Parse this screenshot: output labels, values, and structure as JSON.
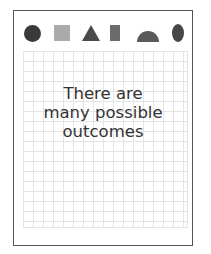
{
  "card": {
    "shapes": [
      {
        "name": "circle-icon",
        "color": "#3a3a3a"
      },
      {
        "name": "square-icon",
        "color": "#aaaaaa"
      },
      {
        "name": "triangle-icon",
        "color": "#4a4a4a"
      },
      {
        "name": "rectangle-icon",
        "color": "#6b6b6b"
      },
      {
        "name": "semicircle-icon",
        "color": "#5a5a5a"
      },
      {
        "name": "oval-icon",
        "color": "#474747"
      }
    ],
    "message_lines": [
      "There are",
      "many possible",
      "outcomes"
    ]
  }
}
